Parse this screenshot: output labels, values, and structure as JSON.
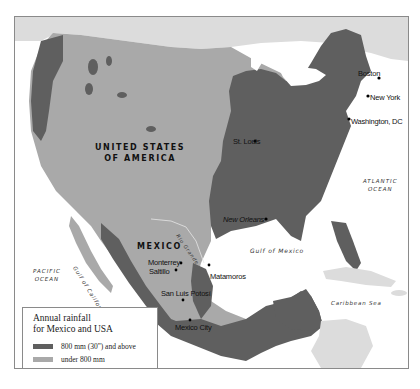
{
  "map": {
    "colors": {
      "high_rainfall": "#5f5f5f",
      "low_rainfall": "#a9a9a9",
      "other_land": "#dcdcdc",
      "water": "#ffffff",
      "border": "#8a8a8a"
    },
    "countries": [
      {
        "name_line1": "UNITED STATES",
        "name_line2": "OF AMERICA"
      },
      {
        "name_line1": "MEXICO"
      }
    ],
    "cities": [
      {
        "name": "Boston"
      },
      {
        "name": "New York"
      },
      {
        "name": "Washington, DC"
      },
      {
        "name": "St. Louis"
      },
      {
        "name": "New Orleans"
      },
      {
        "name": "Monterrey"
      },
      {
        "name": "Saltillo"
      },
      {
        "name": "Matamoros"
      },
      {
        "name": "San Luis Potosí"
      },
      {
        "name": "Mexico City"
      }
    ],
    "water_bodies": [
      {
        "line1": "ATLANTIC",
        "line2": "OCEAN"
      },
      {
        "line1": "PACIFIC",
        "line2": "OCEAN"
      },
      {
        "name": "Gulf of Mexico"
      },
      {
        "name": "Gulf of California"
      },
      {
        "name": "Caribbean Sea"
      }
    ],
    "rivers": [
      {
        "name": "Rio Grande"
      }
    ]
  },
  "legend": {
    "title_line1": "Annual rainfall",
    "title_line2": "for Mexico and USA",
    "items": [
      {
        "label": "800 mm (30\") and above",
        "color": "#5f5f5f"
      },
      {
        "label": "under 800 mm",
        "color": "#a9a9a9"
      }
    ]
  }
}
